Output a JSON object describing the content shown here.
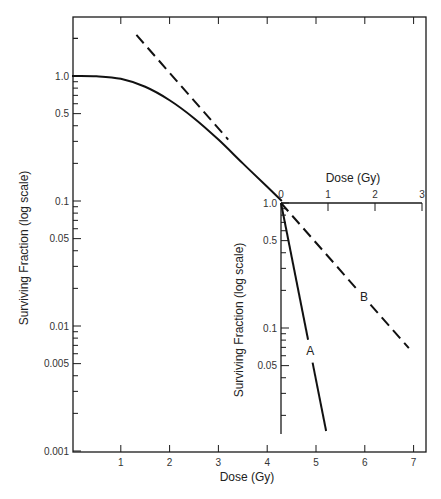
{
  "chart_data": [
    {
      "name": "main",
      "type": "line",
      "xlabel": "Dose (Gy)",
      "ylabel": "Surviving Fraction (log scale)",
      "yscale": "log",
      "xlim": [
        0,
        7.3
      ],
      "ylim": [
        0.001,
        2.8
      ],
      "x_ticks": [
        1,
        2,
        3,
        4,
        5,
        6,
        7
      ],
      "x_tick_labels": [
        "1",
        "2",
        "3",
        "4",
        "5",
        "6",
        "7"
      ],
      "y_tick_labels": [
        {
          "value": 1.0,
          "label": "1.0"
        },
        {
          "value": 0.5,
          "label": "0.5"
        },
        {
          "value": 0.1,
          "label": "0.1"
        },
        {
          "value": 0.05,
          "label": "0.05"
        },
        {
          "value": 0.01,
          "label": "0.01"
        },
        {
          "value": 0.005,
          "label": "0.005"
        },
        {
          "value": 0.001,
          "label": "0.001"
        }
      ],
      "grid": false,
      "series": [
        {
          "name": "survival-curve",
          "style": "solid",
          "x": [
            0,
            0.5,
            1.0,
            1.5,
            2.0,
            2.5,
            3.0,
            3.5,
            4.0,
            4.3
          ],
          "y": [
            1.0,
            0.995,
            0.95,
            0.82,
            0.64,
            0.46,
            0.31,
            0.2,
            0.13,
            0.1
          ]
        },
        {
          "name": "extrapolation",
          "style": "dashed",
          "x": [
            1.32,
            3.2
          ],
          "y": [
            2.13,
            0.31
          ]
        }
      ]
    },
    {
      "name": "inset",
      "type": "line",
      "xlabel": "Dose (Gy)",
      "ylabel": "Surviving Fraction (log scale)",
      "yscale": "log",
      "xlim": [
        0,
        3
      ],
      "ylim": [
        0.012,
        1.0
      ],
      "x_axis_position": "top",
      "x_ticks": [
        0,
        1,
        2,
        3
      ],
      "x_tick_labels": [
        "0",
        "1",
        "2",
        "3"
      ],
      "y_tick_labels": [
        {
          "value": 1.0,
          "label": "1.0"
        },
        {
          "value": 0.5,
          "label": "0.5"
        },
        {
          "value": 0.1,
          "label": "0.1"
        },
        {
          "value": 0.05,
          "label": "0.05"
        }
      ],
      "grid": false,
      "series": [
        {
          "name": "A",
          "label": "A",
          "style": "solid",
          "x": [
            0,
            0.96
          ],
          "y": [
            1.0,
            0.015
          ]
        },
        {
          "name": "B",
          "label": "B",
          "style": "dashed",
          "x": [
            0,
            2.72
          ],
          "y": [
            1.0,
            0.069
          ]
        }
      ]
    }
  ]
}
